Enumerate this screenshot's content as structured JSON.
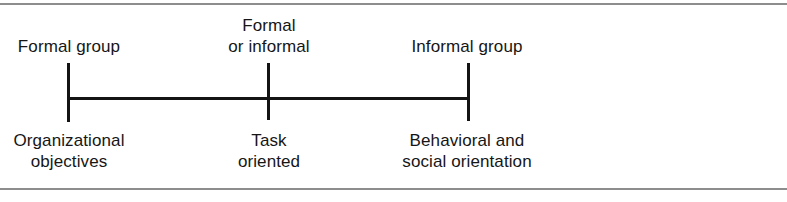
{
  "figure": {
    "axis": {
      "orientation": "horizontal",
      "start_x": 68,
      "end_x": 468,
      "tick_count": 3
    },
    "colors": {
      "axis": "#141414",
      "rule": "#8d8d8d",
      "text": "#161616",
      "background": "#ffffff"
    }
  },
  "labels_above": [
    {
      "id": "formal-group",
      "lines": [
        "Formal group"
      ]
    },
    {
      "id": "formal-informal",
      "lines": [
        "Formal",
        "or informal"
      ]
    },
    {
      "id": "informal-group",
      "lines": [
        "Informal group"
      ]
    }
  ],
  "labels_below": [
    {
      "id": "organizational-objectives",
      "lines": [
        "Organizational",
        "objectives"
      ]
    },
    {
      "id": "task-oriented",
      "lines": [
        "Task",
        "oriented"
      ]
    },
    {
      "id": "behavioral-social",
      "lines": [
        "Behavioral and",
        "social orientation"
      ]
    }
  ],
  "text": {
    "above": {
      "formal_group": "Formal group",
      "formal_1": "Formal",
      "formal_2": "or informal",
      "informal_group": "Informal group"
    },
    "below": {
      "org_1": "Organizational",
      "org_2": "objectives",
      "task_1": "Task",
      "task_2": "oriented",
      "behav_1": "Behavioral and",
      "behav_2": "social orientation"
    }
  }
}
